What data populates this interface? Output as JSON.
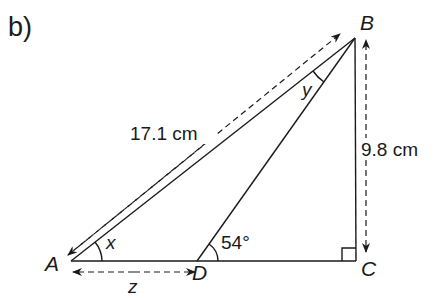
{
  "part_label": "b)",
  "vertices": {
    "A": "A",
    "B": "B",
    "C": "C",
    "D": "D"
  },
  "measurements": {
    "AB_length": "17.1 cm",
    "BC_length": "9.8 cm",
    "angle_BDC": "54°"
  },
  "unknowns": {
    "angle_at_A": "x",
    "angle_at_B": "y",
    "length_AD": "z"
  },
  "colors": {
    "line": "#1a1a1a",
    "background": "#ffffff"
  }
}
